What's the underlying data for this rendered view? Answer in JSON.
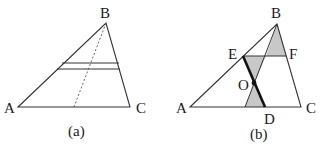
{
  "figure": {
    "panels": [
      {
        "caption": "(a)",
        "labels": {
          "A": "A",
          "B": "B",
          "C": "C"
        },
        "points": {
          "A": [
            18,
            107
          ],
          "B": [
            106,
            23
          ],
          "C": [
            130,
            107
          ],
          "dotted_foot": [
            74,
            107
          ]
        },
        "parallel_lines": [
          {
            "y": 63,
            "x1": 62,
            "x2": 119
          },
          {
            "y": 69,
            "x1": 57,
            "x2": 120
          }
        ]
      },
      {
        "caption": "(b)",
        "labels": {
          "A": "A",
          "B": "B",
          "C": "C",
          "D": "D",
          "E": "E",
          "F": "F",
          "O": "O"
        },
        "points": {
          "A": [
            190,
            107
          ],
          "B": [
            277,
            24
          ],
          "C": [
            301,
            107
          ],
          "D": [
            265,
            107
          ],
          "E": [
            243,
            56
          ],
          "F": [
            286,
            56
          ],
          "O": [
            254,
            83
          ]
        },
        "shaded_color": "#c8c8c8"
      }
    ],
    "line_color": "#333333"
  }
}
